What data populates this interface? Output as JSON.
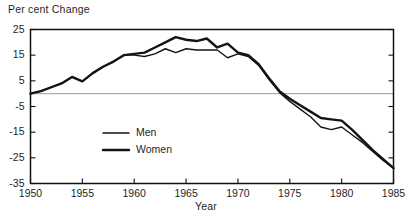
{
  "chart_data": {
    "type": "line",
    "title": "Per cent Change",
    "xlabel": "Year",
    "ylabel": "",
    "xlim": [
      1950,
      1985
    ],
    "ylim": [
      -35,
      25
    ],
    "xticks": [
      1950,
      1955,
      1960,
      1965,
      1970,
      1975,
      1980,
      1985
    ],
    "yticks": [
      -35,
      -25,
      -15,
      -5,
      5,
      15,
      25
    ],
    "grid": false,
    "zero_reference_line": 0,
    "legend_position": "center-left",
    "legend": [
      "Men",
      "Women"
    ],
    "x": [
      1950,
      1951,
      1952,
      1953,
      1954,
      1955,
      1956,
      1957,
      1958,
      1959,
      1960,
      1961,
      1962,
      1963,
      1964,
      1965,
      1966,
      1967,
      1968,
      1969,
      1970,
      1971,
      1972,
      1973,
      1974,
      1975,
      1976,
      1977,
      1978,
      1979,
      1980,
      1981,
      1982,
      1983,
      1984,
      1985
    ],
    "series": [
      {
        "name": "Men",
        "values": [
          0.0,
          1.0,
          2.5,
          4.0,
          6.5,
          4.8,
          8.0,
          10.5,
          12.5,
          15.0,
          15.0,
          14.5,
          15.5,
          17.5,
          16.0,
          17.5,
          17.0,
          17.0,
          17.0,
          14.0,
          15.5,
          14.5,
          11.0,
          5.5,
          0.5,
          -3.0,
          -6.0,
          -9.0,
          -13.0,
          -14.0,
          -13.0,
          -16.0,
          -19.0,
          -22.5,
          -26.0,
          -29.0
        ]
      },
      {
        "name": "Women",
        "values": [
          0.0,
          1.0,
          2.5,
          4.0,
          6.5,
          4.8,
          8.0,
          10.5,
          12.5,
          15.0,
          15.5,
          16.0,
          18.0,
          20.0,
          22.0,
          21.0,
          20.5,
          21.5,
          18.0,
          19.5,
          16.0,
          15.0,
          11.5,
          6.0,
          1.0,
          -2.0,
          -4.5,
          -7.0,
          -9.5,
          -10.0,
          -10.5,
          -14.0,
          -18.0,
          -22.0,
          -25.5,
          -29.0
        ]
      }
    ]
  },
  "legend_entries": [
    {
      "label": "Men",
      "line_width": 1.4
    },
    {
      "label": "Women",
      "line_width": 2.4
    }
  ],
  "colors": {
    "line": "#141414",
    "axis": "#111111",
    "zero_line": "#8f8f8f",
    "text": "#1f1f1f",
    "background": "#ffffff"
  }
}
